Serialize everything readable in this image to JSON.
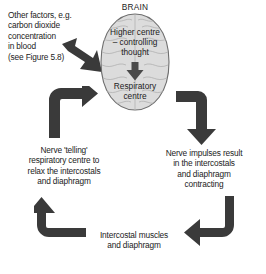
{
  "diagram": {
    "type": "cycle-flow-diagram",
    "topic": "Nervous control of breathing",
    "colors": {
      "arrow_fill": "#3a3a3a",
      "brain_fill": "#dcdcdc",
      "brain_outline": "#6e6e6e",
      "text": "#1b1b1b",
      "background": "#ffffff"
    }
  },
  "brain": {
    "label": "BRAIN",
    "higher_centre": "Higher centre\n– controlling\nthought",
    "respiratory_centre": "Respiratory\ncentre",
    "internal_arrow": "down-arrow-icon"
  },
  "inputs": {
    "other_factors": "Other factors, e.g.\ncarbon dioxide\nconcentration\nin blood\n(see Figure 5.8)",
    "other_factors_arrow": "diagonal-arrow-icon"
  },
  "steps": [
    {
      "id": "nerve-impulses",
      "text": "Nerve impulses result\nin the intercostals\nand diaphragm\ncontracting",
      "position": "right"
    },
    {
      "id": "intercostal-muscles",
      "text": "Intercostal muscles\nand diaphragm",
      "position": "bottom"
    },
    {
      "id": "nerve-telling",
      "text": "Nerve 'telling'\nrespiratory centre to\nrelax the intercostals\nand diaphragm",
      "position": "left"
    }
  ],
  "arrows": [
    {
      "id": "brain-to-right",
      "name": "elbow-arrow-right-down",
      "direction": "down"
    },
    {
      "id": "right-to-bottom",
      "name": "elbow-arrow-down-left",
      "direction": "left"
    },
    {
      "id": "bottom-to-left",
      "name": "elbow-arrow-left-up",
      "direction": "up"
    },
    {
      "id": "left-to-brain",
      "name": "elbow-arrow-up-right",
      "direction": "right"
    }
  ]
}
